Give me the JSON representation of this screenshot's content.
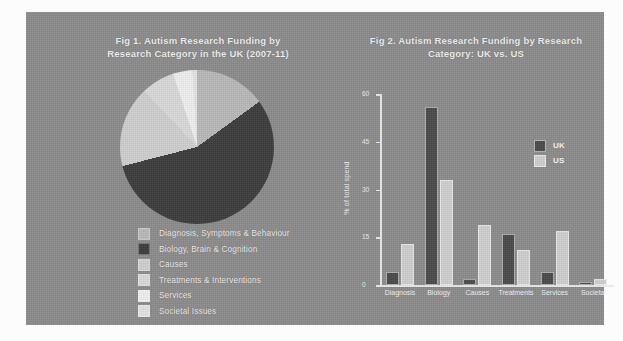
{
  "figure": {
    "background_color": "#8c8c8c",
    "page_color": "#fcfcfc"
  },
  "fig1": {
    "title_line1": "Fig 1. Autism Research Funding by",
    "title_line2": "Research Category in the UK (2007-11)",
    "chart_data": {
      "type": "pie",
      "title": "Fig 1. Autism Research Funding by Research Category in the UK (2007-11)",
      "labels": [
        "Diagnosis, Symptoms & Behaviour",
        "Biology, Brain & Cognition",
        "Causes",
        "Treatments & Interventions",
        "Services",
        "Societal Issues"
      ],
      "values": [
        15,
        56,
        17,
        7,
        4,
        1
      ],
      "colors": [
        "#b9b9b9",
        "#3c3c3c",
        "#cfcfcf",
        "#d9d9d9",
        "#efefef",
        "#e4e4e4"
      ],
      "legend_position": "bottom-left"
    }
  },
  "fig2": {
    "title_line1": "Fig 2. Autism Research Funding by Research",
    "title_line2": "Category: UK vs. US",
    "chart_data": {
      "type": "bar",
      "title": "Fig 2. Autism Research Funding by Research Category: UK vs. US",
      "xlabel": "",
      "ylabel": "% of total spend",
      "ylim": [
        0,
        60
      ],
      "yticks": [
        0,
        15,
        30,
        45,
        60
      ],
      "grid": false,
      "categories": [
        "Diagnosis",
        "Biology",
        "Causes",
        "Treatments",
        "Services",
        "Societal"
      ],
      "series": [
        {
          "name": "UK",
          "color": "#4a4a4a",
          "values": [
            4,
            56,
            2,
            16,
            4,
            1
          ]
        },
        {
          "name": "US",
          "color": "#cfcfcf",
          "values": [
            13,
            33,
            19,
            11,
            17,
            2
          ]
        }
      ],
      "legend_position": "upper-right",
      "legend_entries": [
        "UK",
        "US"
      ]
    }
  }
}
